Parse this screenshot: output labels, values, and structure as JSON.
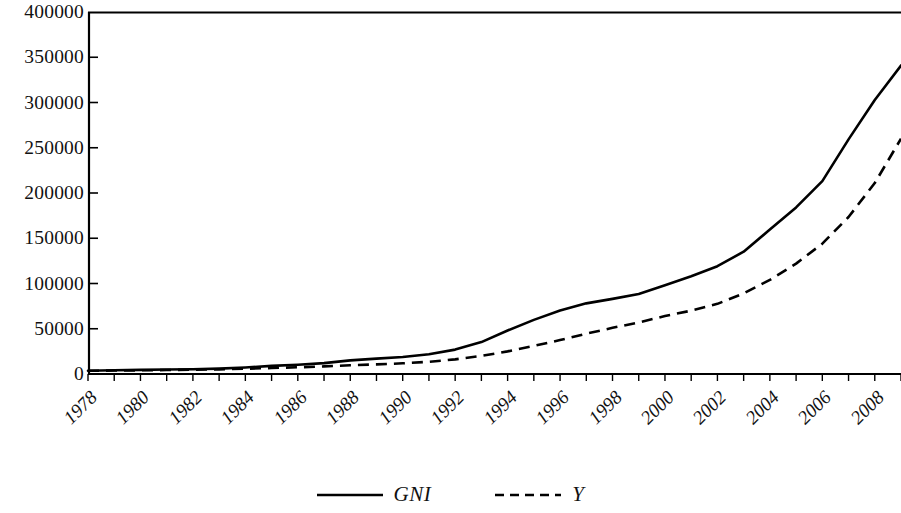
{
  "chart_data": {
    "type": "line",
    "title": "",
    "subtitle": "",
    "xlabel": "",
    "ylabel": "",
    "x": [
      1978,
      1979,
      1980,
      1981,
      1982,
      1983,
      1984,
      1985,
      1986,
      1987,
      1988,
      1989,
      1990,
      1991,
      1992,
      1993,
      1994,
      1995,
      1996,
      1997,
      1998,
      1999,
      2000,
      2001,
      2002,
      2003,
      2004,
      2005,
      2006,
      2007,
      2008,
      2009
    ],
    "xlim": [
      1978,
      2009
    ],
    "ylim": [
      0,
      400000
    ],
    "y_ticks": [
      0,
      50000,
      100000,
      150000,
      200000,
      250000,
      300000,
      350000,
      400000
    ],
    "y_tick_labels": [
      "0",
      "50000",
      "100000",
      "150000",
      "200000",
      "250000",
      "300000",
      "350000",
      "400000"
    ],
    "x_tick_labels": [
      "1978",
      "1980",
      "1982",
      "1984",
      "1986",
      "1988",
      "1990",
      "1992",
      "1994",
      "1996",
      "1998",
      "2000",
      "2002",
      "2004",
      "2006",
      "2008"
    ],
    "x_tick_label_rotation": -45,
    "grid": false,
    "legend_position": "bottom-center",
    "frame": "top-and-left-axis",
    "series": [
      {
        "name": "GNI",
        "style": "solid",
        "color": "#000000",
        "values": [
          3645,
          4063,
          4546,
          4892,
          5323,
          5963,
          7208,
          9016,
          10275,
          12059,
          15043,
          17001,
          18718,
          21826,
          26937,
          35260,
          48108,
          59811,
          70142,
          78061,
          83024,
          88479,
          98000,
          108068,
          119096,
          135174,
          159587,
          184089,
          213132,
          259258,
          302853,
          340903
        ]
      },
      {
        "name": "Y",
        "style": "dashed",
        "color": "#000000",
        "values": [
          3545,
          3830,
          4090,
          4360,
          4680,
          5120,
          5800,
          6600,
          7400,
          8400,
          9600,
          10600,
          11800,
          13500,
          16200,
          20000,
          25000,
          31000,
          37500,
          44500,
          51000,
          57000,
          64000,
          70000,
          77500,
          89000,
          104000,
          122000,
          144000,
          173500,
          211000,
          260000
        ]
      }
    ],
    "legend": [
      {
        "label": "GNI",
        "style": "solid"
      },
      {
        "label": "Y",
        "style": "dashed"
      }
    ],
    "axis_geometry": {
      "plot_left_px": 88,
      "plot_right_px": 901,
      "plot_top_px": 12,
      "plot_bottom_px": 374
    }
  }
}
